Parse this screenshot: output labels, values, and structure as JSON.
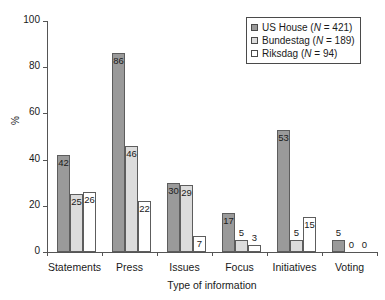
{
  "chart_data": {
    "type": "bar",
    "title": "",
    "xlabel": "Type of information",
    "ylabel": "%",
    "ylim": [
      0,
      100
    ],
    "yticks": [
      0,
      20,
      40,
      60,
      80,
      100
    ],
    "grid": false,
    "legend_position": "top-right",
    "categories": [
      "Statements",
      "Press",
      "Issues",
      "Focus",
      "Initiatives",
      "Voting"
    ],
    "series": [
      {
        "name": "US House",
        "n_label": "(N = 421)",
        "legend_label": "US House (N = 421)",
        "color": "#9a9a9a",
        "values": [
          42,
          86,
          30,
          17,
          53,
          5
        ]
      },
      {
        "name": "Bundestag",
        "n_label": "(N = 189)",
        "legend_label": "Bundestag (N = 189)",
        "color": "#dcdcdc",
        "values": [
          25,
          46,
          29,
          5,
          5,
          0
        ]
      },
      {
        "name": "Riksdag",
        "n_label": "(N = 94)",
        "legend_label": "Riksdag (N = 94)",
        "color": "#ffffff",
        "values": [
          26,
          22,
          7,
          3,
          15,
          0
        ]
      }
    ]
  }
}
